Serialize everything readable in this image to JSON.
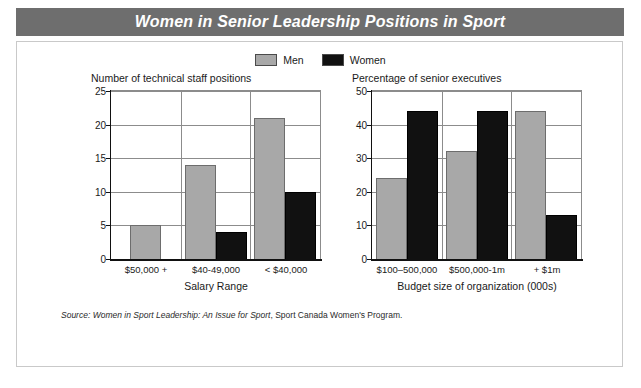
{
  "title": "Women in Senior Leadership Positions in Sport",
  "legend": {
    "items": [
      {
        "label": "Men",
        "color": "#a8a8a8"
      },
      {
        "label": "Women",
        "color": "#111111"
      }
    ]
  },
  "source": {
    "prefix": "Source: ",
    "italic_title": "Women in Sport Leadership: An Issue for Sport",
    "suffix": ", Sport Canada Women's Program."
  },
  "chart_data": [
    {
      "type": "bar",
      "title": "Number of technical staff positions",
      "xlabel": "Salary Range",
      "ylabel": "",
      "categories": [
        "$50,000 +",
        "$40-49,000",
        "< $40,000"
      ],
      "series": [
        {
          "name": "Men",
          "color": "#a8a8a8",
          "values": [
            5,
            14,
            21
          ]
        },
        {
          "name": "Women",
          "color": "#111111",
          "values": [
            0,
            4,
            10
          ]
        }
      ],
      "ylim": [
        0,
        25
      ],
      "yticks": [
        0,
        5,
        10,
        15,
        20,
        25
      ],
      "grid": true,
      "legend_position": "top-center"
    },
    {
      "type": "bar",
      "title": "Percentage of senior executives",
      "xlabel": "Budget size of organization (000s)",
      "ylabel": "",
      "categories": [
        "$100–500,000",
        "$500,000-1m",
        "+ $1m"
      ],
      "series": [
        {
          "name": "Men",
          "color": "#a8a8a8",
          "values": [
            24,
            32,
            44
          ]
        },
        {
          "name": "Women",
          "color": "#111111",
          "values": [
            44,
            44,
            13
          ]
        }
      ],
      "ylim": [
        0,
        50
      ],
      "yticks": [
        0,
        10,
        20,
        30,
        40,
        50
      ],
      "grid": true,
      "legend_position": "top-center"
    }
  ]
}
